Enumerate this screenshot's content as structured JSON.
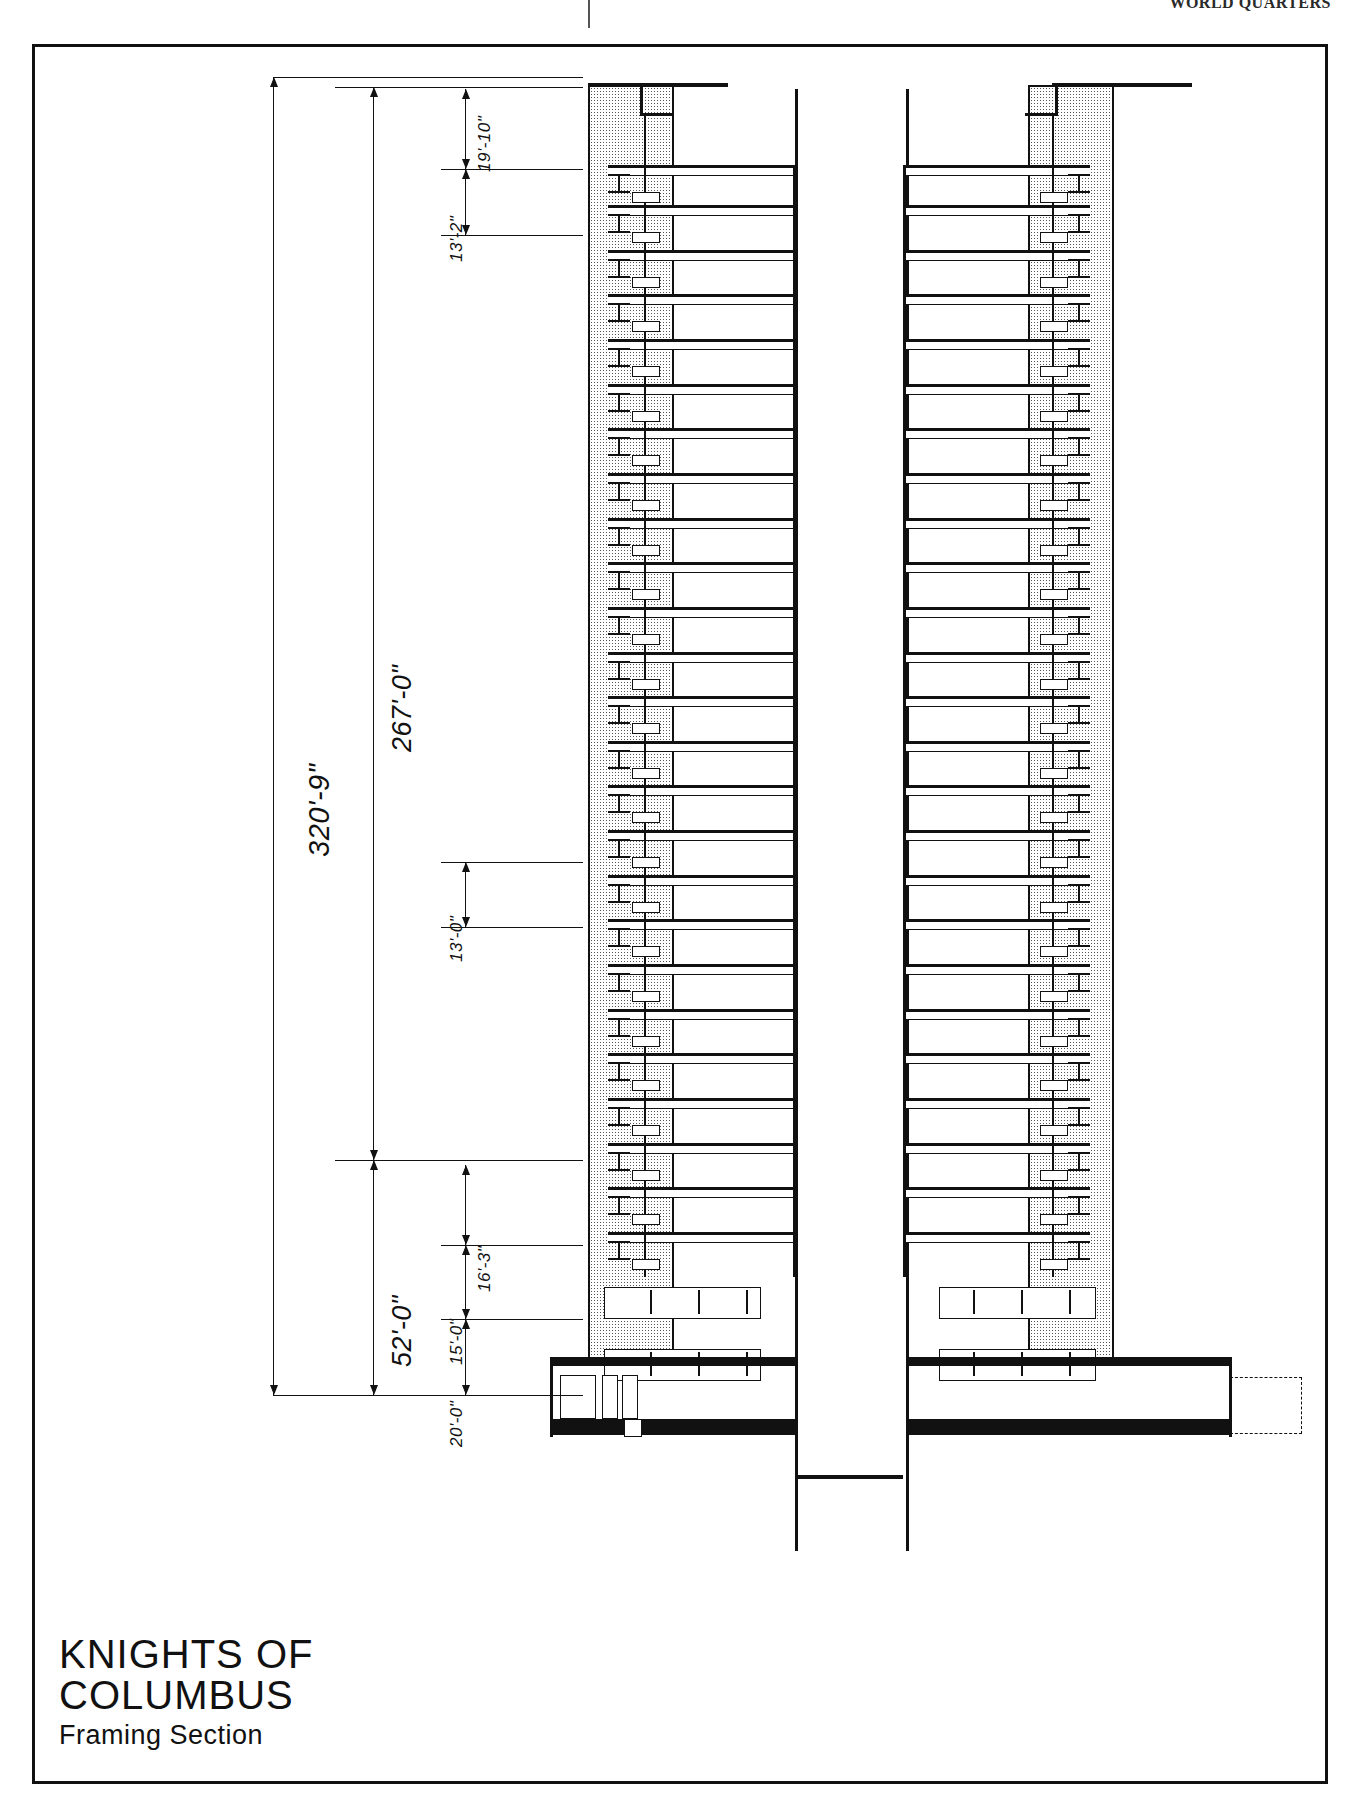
{
  "page": {
    "header_text": "WORLD QUARTERS"
  },
  "titleblock": {
    "line1": "KNIGHTS OF",
    "line2": "COLUMBUS",
    "line3": "Framing  Section"
  },
  "dimensions": {
    "overall": "320'-9\"",
    "tower": "267'-0\"",
    "base": "52'-0\"",
    "roof_parapet": "19'-10\"",
    "mech_floor": "13'-2\"",
    "typical_floor": "13'-0\"",
    "lobby_upper": "16'-3\"",
    "lobby_mid": "15'-0\"",
    "lobby_lower": "20'-0\""
  },
  "drawing": {
    "type": "building-framing-section",
    "floor_count": 26,
    "elements": [
      "shear-wall-left",
      "shear-wall-right",
      "central-core",
      "floor-beams",
      "column-splices",
      "foundation-mat",
      "basement"
    ]
  }
}
